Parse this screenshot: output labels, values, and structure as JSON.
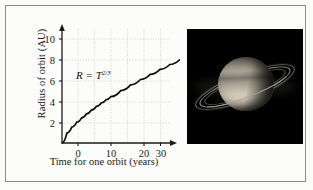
{
  "figure": {
    "name": "planetary-orbit-figure",
    "background_color": "#fbfbf9",
    "frame_color": "#8c8c8c"
  },
  "chart_data": {
    "type": "line",
    "title": "",
    "xlabel": "Time for one orbit (years)",
    "ylabel": "Radius of orbit (AU)",
    "annotation": "R = T",
    "annotation_exponent": "2/3",
    "equation": "R = T^(2/3)",
    "xlim": [
      0,
      32
    ],
    "ylim": [
      0,
      10.8
    ],
    "xticks": [
      0,
      10,
      20,
      30
    ],
    "xtick_labels": [
      "0",
      "10",
      "20",
      "30"
    ],
    "yticks": [
      2,
      4,
      6,
      8,
      10
    ],
    "ytick_labels": [
      "2",
      "4",
      "6",
      "8",
      "10"
    ],
    "grid": true,
    "grid_style": "dotted",
    "grid_color": "#c9c9c4",
    "legend": "none",
    "axis_arrows": true,
    "line_color": "#0d0d0d",
    "x": [
      0,
      1,
      2,
      3,
      4,
      5,
      6,
      7,
      8,
      9,
      10,
      12,
      14,
      16,
      18,
      20,
      22,
      24,
      26,
      28,
      30
    ],
    "y": [
      0,
      1.0,
      1.587,
      2.08,
      2.52,
      2.924,
      3.302,
      3.659,
      4.0,
      4.327,
      4.642,
      5.241,
      5.809,
      6.35,
      6.868,
      7.368,
      7.85,
      8.32,
      8.776,
      9.22,
      9.655
    ]
  },
  "photo": {
    "subject": "saturn-photograph",
    "background_color": "#000000",
    "description": "Saturn with rings"
  }
}
